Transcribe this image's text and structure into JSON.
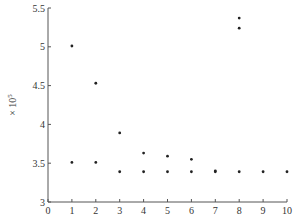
{
  "chart_data": {
    "type": "scatter",
    "title": "",
    "xlabel": "",
    "ylabel": "×10^5",
    "ylabel_base": "× 10",
    "ylabel_exp": "5",
    "xlim": [
      0,
      10
    ],
    "ylim": [
      3,
      5.5
    ],
    "grid": false,
    "legend": null,
    "x_ticks": [
      0,
      1,
      2,
      3,
      4,
      5,
      6,
      7,
      8,
      9,
      10
    ],
    "x_tick_labels": [
      "0",
      "1",
      "2",
      "3",
      "4",
      "5",
      "6",
      "7",
      "8",
      "9",
      "10"
    ],
    "y_ticks": [
      3,
      3.5,
      4,
      4.5,
      5,
      5.5
    ],
    "y_tick_labels": [
      "3",
      "3.5",
      "4",
      "4.5",
      "5",
      "5.5"
    ],
    "series": [
      {
        "name": "points",
        "marker": "dot",
        "color": "#222222",
        "points": [
          {
            "x": 1,
            "y": 5.01
          },
          {
            "x": 1,
            "y": 3.51
          },
          {
            "x": 2,
            "y": 4.53
          },
          {
            "x": 2,
            "y": 3.51
          },
          {
            "x": 3,
            "y": 3.89
          },
          {
            "x": 3,
            "y": 3.39
          },
          {
            "x": 4,
            "y": 3.63
          },
          {
            "x": 4,
            "y": 3.39
          },
          {
            "x": 5,
            "y": 3.59
          },
          {
            "x": 5,
            "y": 3.39
          },
          {
            "x": 6,
            "y": 3.55
          },
          {
            "x": 6,
            "y": 3.39
          },
          {
            "x": 7,
            "y": 3.4
          },
          {
            "x": 7,
            "y": 3.39
          },
          {
            "x": 8,
            "y": 5.37
          },
          {
            "x": 8,
            "y": 5.24
          },
          {
            "x": 8,
            "y": 3.39
          },
          {
            "x": 9,
            "y": 3.39
          },
          {
            "x": 10,
            "y": 3.39
          }
        ]
      }
    ]
  },
  "colors": {
    "axis": "#555555",
    "marker": "#222222",
    "background": "#ffffff"
  }
}
